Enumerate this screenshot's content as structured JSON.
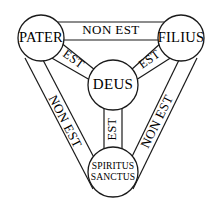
{
  "diagram": {
    "background_color": "#ffffff",
    "stroke_color": "#1a1a1a",
    "text_color": "#000000",
    "nodes": [
      {
        "id": "pater",
        "label": "PATER",
        "cx": 41,
        "cy": 38,
        "r": 23
      },
      {
        "id": "filius",
        "label": "FILIUS",
        "cx": 181,
        "cy": 38,
        "r": 23
      },
      {
        "id": "deus",
        "label": "DEUS",
        "cx": 113,
        "cy": 85,
        "r": 25
      },
      {
        "id": "spiritus",
        "label_line1": "SPIRITUS",
        "label_line2": "SANCTUS",
        "cx": 113,
        "cy": 172,
        "r": 25
      }
    ],
    "bands": [
      {
        "id": "pater-filius",
        "label": "NON EST",
        "from": "pater",
        "to": "filius",
        "orientation": "horizontal"
      },
      {
        "id": "pater-spiritus",
        "label": "NON EST",
        "from": "pater",
        "to": "spiritus",
        "orientation": "diagonal-left"
      },
      {
        "id": "filius-spiritus",
        "label": "NON EST",
        "from": "filius",
        "to": "spiritus",
        "orientation": "diagonal-right"
      },
      {
        "id": "pater-deus",
        "label": "EST",
        "from": "pater",
        "to": "deus",
        "orientation": "diagonal-in-left"
      },
      {
        "id": "filius-deus",
        "label": "EST",
        "from": "filius",
        "to": "deus",
        "orientation": "diagonal-in-right"
      },
      {
        "id": "spiritus-deus",
        "label": "EST",
        "from": "spiritus",
        "to": "deus",
        "orientation": "vertical"
      }
    ]
  }
}
